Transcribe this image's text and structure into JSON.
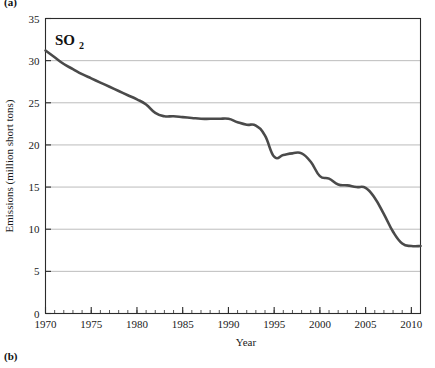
{
  "figure": {
    "panel_label_top": "(a)",
    "panel_label_bottom": "(b)"
  },
  "chart_data": {
    "type": "line",
    "title": "",
    "annotation": "SO2",
    "annotation_base": "SO",
    "annotation_subscript": "2",
    "xlabel": "Year",
    "ylabel": "Emissions (million short tons)",
    "xlim": [
      1970,
      2011
    ],
    "ylim": [
      0,
      35
    ],
    "xticks": [
      1970,
      1975,
      1980,
      1985,
      1990,
      1995,
      2000,
      2005,
      2010
    ],
    "xtick_labels": [
      "1970",
      "1975",
      "1980",
      "1985",
      "1990",
      "1995",
      "2000",
      "2005",
      "2010"
    ],
    "yticks": [
      0,
      5,
      10,
      15,
      20,
      25,
      30,
      35
    ],
    "ytick_labels": [
      "0",
      "5",
      "10",
      "15",
      "20",
      "25",
      "30",
      "35"
    ],
    "x_minor_tick_interval": 1,
    "grid": "horizontal-major",
    "grid_color": "#b4b4b4",
    "legend": "none",
    "line_color": "#4a4a4a",
    "line_width": 2.6,
    "axis_color": "#2b2b2b",
    "x": [
      1970,
      1971,
      1972,
      1973,
      1974,
      1975,
      1976,
      1977,
      1978,
      1979,
      1980,
      1981,
      1982,
      1983,
      1984,
      1985,
      1986,
      1987,
      1988,
      1989,
      1990,
      1991,
      1992,
      1993,
      1994,
      1995,
      1996,
      1997,
      1998,
      1999,
      2000,
      2001,
      2002,
      2003,
      2004,
      2005,
      2006,
      2007,
      2008,
      2009,
      2010,
      2011
    ],
    "values": [
      31.2,
      30.4,
      29.6,
      29.0,
      28.4,
      27.9,
      27.4,
      26.9,
      26.4,
      25.9,
      25.4,
      24.8,
      23.8,
      23.4,
      23.4,
      23.3,
      23.2,
      23.1,
      23.1,
      23.1,
      23.1,
      22.7,
      22.4,
      22.3,
      21.1,
      18.6,
      18.8,
      19.0,
      19.0,
      18.0,
      16.3,
      16.0,
      15.3,
      15.2,
      15.0,
      14.9,
      13.7,
      11.8,
      9.7,
      8.3,
      8.0,
      8.0
    ]
  }
}
